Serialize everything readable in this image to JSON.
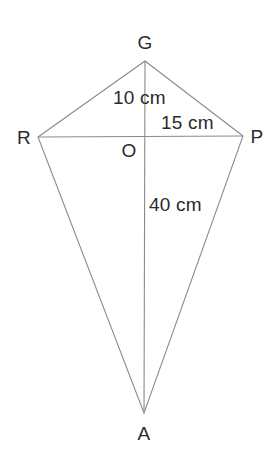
{
  "figure": {
    "type": "geometry-diagram",
    "shape": "kite",
    "background_color": "#ffffff",
    "line_color": "#8a8a8a",
    "text_color": "#2b2b2b",
    "vertices": [
      {
        "id": "G",
        "label": "G",
        "x": 145,
        "y": 61,
        "role": "top-vertex"
      },
      {
        "id": "R",
        "label": "R",
        "x": 38,
        "y": 137,
        "role": "left-vertex"
      },
      {
        "id": "P",
        "label": "P",
        "x": 243,
        "y": 136,
        "role": "right-vertex"
      },
      {
        "id": "A",
        "label": "A",
        "x": 144,
        "y": 413,
        "role": "bottom-vertex"
      },
      {
        "id": "O",
        "label": "O",
        "x": 144,
        "y": 137,
        "role": "diagonal-intersection"
      }
    ],
    "edges": [
      {
        "from": "G",
        "to": "R"
      },
      {
        "from": "G",
        "to": "P"
      },
      {
        "from": "R",
        "to": "A"
      },
      {
        "from": "P",
        "to": "A"
      }
    ],
    "diagonals": [
      {
        "from": "G",
        "to": "A",
        "orientation": "vertical"
      },
      {
        "from": "R",
        "to": "P",
        "orientation": "horizontal"
      }
    ],
    "measurements": [
      {
        "id": "GO",
        "value": "10 cm",
        "segment": "G-O"
      },
      {
        "id": "OP",
        "value": "15 cm",
        "segment": "O-P"
      },
      {
        "id": "OA",
        "value": "40 cm",
        "segment": "O-A"
      }
    ]
  }
}
